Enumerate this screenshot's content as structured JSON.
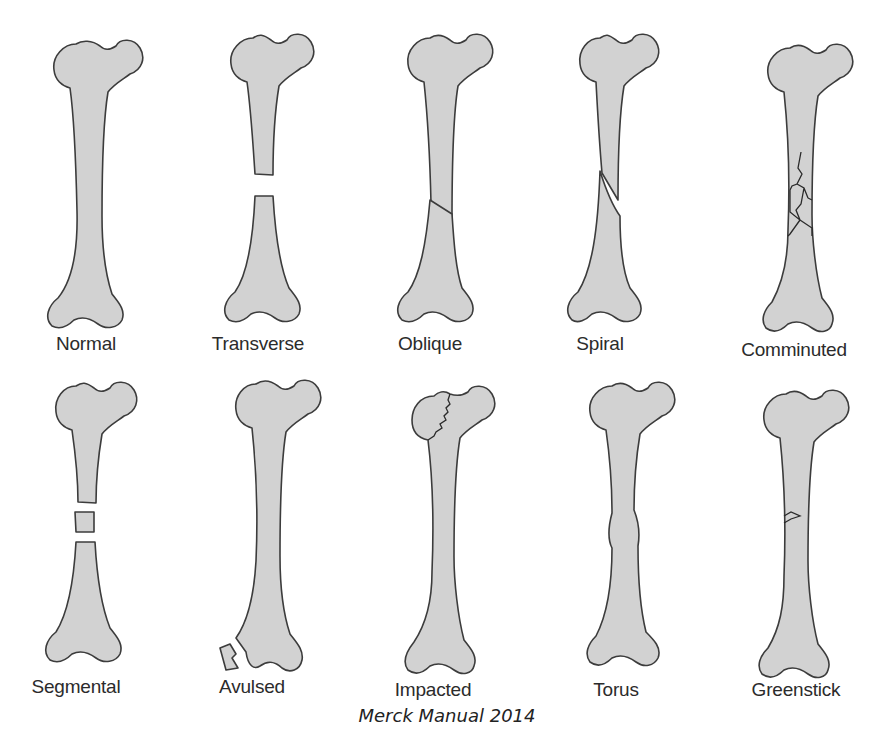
{
  "figure": {
    "caption": "Merck Manual 2014",
    "colors": {
      "bone_fill": "#d2d2d2",
      "outline": "#3c3c3c",
      "background": "#ffffff"
    },
    "rows": [
      {
        "items": [
          {
            "label": "Normal"
          },
          {
            "label": "Transverse"
          },
          {
            "label": "Oblique"
          },
          {
            "label": "Spiral"
          },
          {
            "label": "Comminuted"
          }
        ]
      },
      {
        "items": [
          {
            "label": "Segmental"
          },
          {
            "label": "Avulsed"
          },
          {
            "label": "Impacted"
          },
          {
            "label": "Torus"
          },
          {
            "label": "Greenstick"
          }
        ]
      }
    ]
  }
}
